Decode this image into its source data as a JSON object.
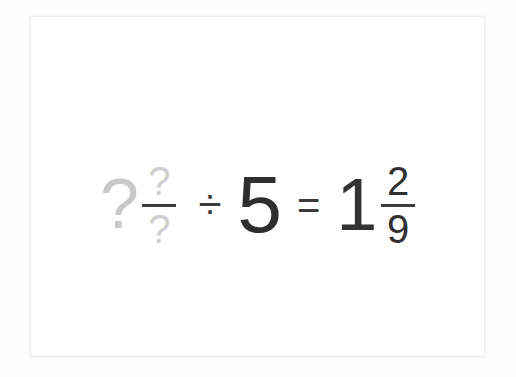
{
  "page": {
    "background_color": "#ffffff",
    "card_border_color": "#ececec"
  },
  "colors": {
    "ink": "#303030",
    "unknown_placeholder": "#cfcfcf",
    "fraction_bar": "#3c3c3c"
  },
  "equation": {
    "expression_text": "? ?/? ÷ 5 = 1 2/9",
    "left_operand": {
      "type": "mixed-number",
      "state": "unknown",
      "whole": "?",
      "numerator": "?",
      "denominator": "?"
    },
    "operator_divide": "÷",
    "right_operand": {
      "type": "whole-number",
      "state": "known",
      "value": "5"
    },
    "operator_equals": "=",
    "result": {
      "type": "mixed-number",
      "state": "known",
      "whole": "1",
      "numerator": "2",
      "denominator": "9"
    }
  },
  "chart_data": {
    "type": "table",
    "categories": [
      "left_operand",
      "operator",
      "right_operand",
      "equals",
      "result"
    ],
    "values": [
      "? ?/?",
      "÷",
      "5",
      "=",
      "1 2/9"
    ]
  }
}
